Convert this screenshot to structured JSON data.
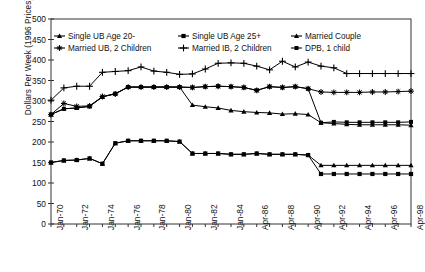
{
  "chart_data": {
    "type": "line",
    "title": "",
    "xlabel": "",
    "ylabel": "Dollars Per Week (1996 Prices)",
    "ylim": [
      0,
      500
    ],
    "ytick_step": 50,
    "yticks": [
      0,
      50,
      100,
      150,
      200,
      250,
      300,
      350,
      400,
      450,
      500
    ],
    "grid": false,
    "legend_position": "top-inside",
    "x": [
      "Jan-70",
      "Jan-71",
      "Jan-72",
      "Jan-73",
      "Jan-74",
      "Jan-75",
      "Jan-76",
      "Jan-77",
      "Jan-78",
      "Jan-79",
      "Jan-80",
      "Jan-81",
      "Jan-82",
      "Jan-83",
      "Jan-84",
      "Jan-85",
      "Apr-86",
      "Apr-87",
      "Apr-88",
      "Apr-89",
      "Apr-90",
      "Apr-91",
      "Apr-92",
      "Apr-93",
      "Apr-94",
      "Apr-95",
      "Apr-96",
      "Apr-97",
      "Apr-98"
    ],
    "xtick_labels": [
      "Jan-70",
      "Jan-72",
      "Jan-74",
      "Jan-76",
      "Jan-78",
      "Jan-80",
      "Jan-82",
      "Jan-84",
      "Apr-86",
      "Apr-88",
      "Apr-90",
      "Apr-92",
      "Apr-94",
      "Apr-96",
      "Apr-98"
    ],
    "series": [
      {
        "name": "Single UB Age 20-",
        "marker": "triangle",
        "values": [
          150,
          155,
          156,
          160,
          147,
          197,
          203,
          203,
          203,
          203,
          201,
          172,
          172,
          172,
          170,
          170,
          172,
          170,
          170,
          170,
          168,
          143,
          143,
          143,
          143,
          143,
          143,
          143,
          143
        ]
      },
      {
        "name": "Single UB Age 25+",
        "marker": "square",
        "values": [
          150,
          155,
          156,
          160,
          147,
          197,
          203,
          203,
          203,
          203,
          201,
          172,
          172,
          172,
          170,
          170,
          172,
          170,
          170,
          170,
          168,
          122,
          122,
          122,
          122,
          122,
          122,
          122,
          122
        ]
      },
      {
        "name": "Married Couple",
        "marker": "triangle",
        "values": [
          267,
          281,
          283,
          287,
          310,
          318,
          334,
          334,
          334,
          334,
          334,
          290,
          286,
          283,
          277,
          274,
          272,
          271,
          268,
          269,
          267,
          247,
          245,
          243,
          242,
          242,
          242,
          242,
          241
        ]
      },
      {
        "name": "Married UB, 2 Children",
        "marker": "star",
        "values": [
          267,
          294,
          287,
          288,
          311,
          317,
          334,
          334,
          334,
          334,
          334,
          333,
          335,
          336,
          335,
          333,
          326,
          335,
          333,
          335,
          330,
          322,
          321,
          321,
          321,
          322,
          322,
          323,
          324
        ]
      },
      {
        "name": "Married IB, 2 Children",
        "marker": "plus",
        "values": [
          302,
          332,
          336,
          336,
          370,
          372,
          374,
          383,
          373,
          370,
          365,
          366,
          378,
          392,
          393,
          392,
          385,
          376,
          397,
          383,
          395,
          385,
          381,
          367,
          367,
          367,
          367,
          367,
          367
        ]
      },
      {
        "name": "DPB, 1 child",
        "marker": "dot",
        "values": [
          267,
          281,
          283,
          287,
          310,
          318,
          334,
          334,
          334,
          334,
          334,
          333,
          335,
          336,
          335,
          333,
          326,
          335,
          333,
          335,
          330,
          247,
          249,
          248,
          248,
          248,
          248,
          248,
          249
        ]
      }
    ],
    "legend": [
      {
        "label": "Single UB Age 20-",
        "marker": "triangle"
      },
      {
        "label": "Single UB Age 25+",
        "marker": "square"
      },
      {
        "label": "Married Couple",
        "marker": "triangle"
      },
      {
        "label": "Married UB, 2 Children",
        "marker": "star"
      },
      {
        "label": "Married IB, 2 Children",
        "marker": "plus"
      },
      {
        "label": "DPB, 1 child",
        "marker": "dot"
      }
    ],
    "colors": {
      "line": "#000000",
      "axis": "#333333",
      "text": "#111111"
    }
  }
}
